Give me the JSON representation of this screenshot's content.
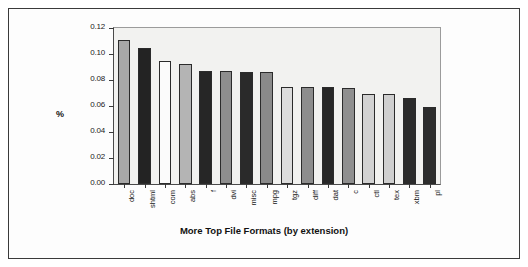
{
  "chart_data": {
    "type": "bar",
    "title": "",
    "xlabel": "More Top File Formats (by extension)",
    "ylabel": "%",
    "ylim": [
      0.0,
      0.12
    ],
    "yticks": [
      "0.00",
      "0.02",
      "0.04",
      "0.06",
      "0.08",
      "0.10",
      "0.12"
    ],
    "ytick_values": [
      0.0,
      0.02,
      0.04,
      0.06,
      0.08,
      0.1,
      0.12
    ],
    "grid": false,
    "legend": "none",
    "categories": [
      "doc",
      "shtml",
      "com",
      "abs",
      "f",
      "dvi",
      "misc",
      "mpg",
      "tgz",
      "diff",
      "dat",
      "c",
      "ctl",
      "tex",
      "xbm",
      "pl"
    ],
    "values": [
      0.111,
      0.105,
      0.095,
      0.092,
      0.087,
      0.087,
      0.086,
      0.086,
      0.075,
      0.075,
      0.075,
      0.074,
      0.069,
      0.069,
      0.066,
      0.059
    ],
    "bar_colors": [
      "#a8a8a8",
      "#232323",
      "#fbfbfb",
      "#b4b4b4",
      "#262626",
      "#8e8e8e",
      "#2a2a2a",
      "#8a8a8a",
      "#dcdcdc",
      "#8d8d8d",
      "#272727",
      "#8f8f8f",
      "#d2d2d2",
      "#cfcfcf",
      "#2b2b2b",
      "#2c2c2c"
    ],
    "series": [
      {
        "name": "percent",
        "values": [
          0.111,
          0.105,
          0.095,
          0.092,
          0.087,
          0.087,
          0.086,
          0.086,
          0.075,
          0.075,
          0.075,
          0.074,
          0.069,
          0.069,
          0.066,
          0.059
        ]
      }
    ]
  },
  "figure": {
    "frame_color": "#3a3a3a",
    "plot_background": "#f2f2f0"
  }
}
